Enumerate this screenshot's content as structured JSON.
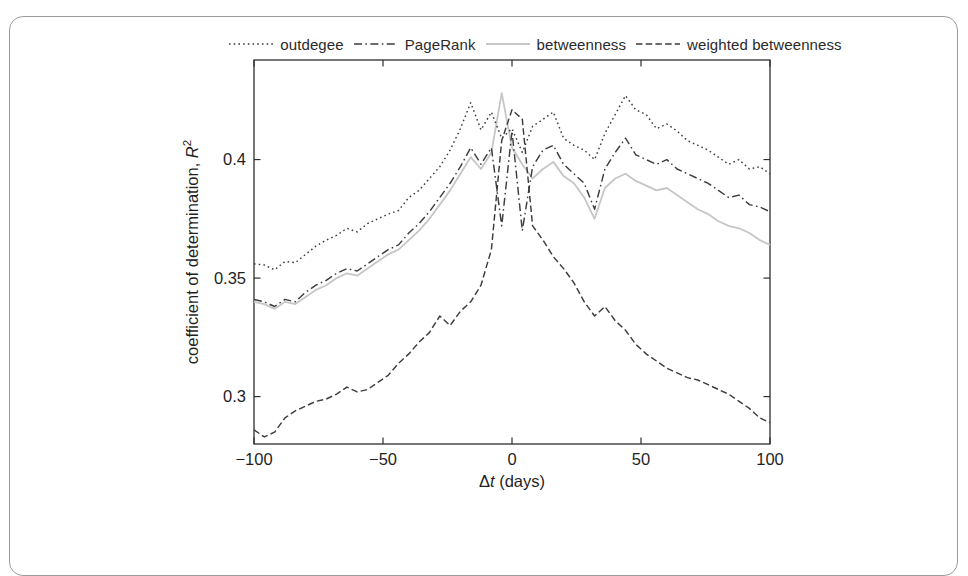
{
  "figure": {
    "background": "#ffffff",
    "border_color": "#9b9b9b",
    "line_dark_color": "#3d3d3d",
    "line_light_color": "#c6c6c6"
  },
  "axes": {
    "xlabel": {
      "delta": "Δ",
      "var": "t",
      "rest": " (days)"
    },
    "ylabel": {
      "text": "coefficient of determination, ",
      "var": "R",
      "sup": "2"
    },
    "xlim": [
      -100,
      100
    ],
    "ylim": [
      0.28,
      0.442
    ],
    "xticks": [
      {
        "v": -100,
        "label": "−100"
      },
      {
        "v": -50,
        "label": "−50"
      },
      {
        "v": 0,
        "label": "0"
      },
      {
        "v": 50,
        "label": "50"
      },
      {
        "v": 100,
        "label": "100"
      }
    ],
    "yticks": [
      {
        "v": 0.3,
        "label": "0.3"
      },
      {
        "v": 0.35,
        "label": "0.35"
      },
      {
        "v": 0.4,
        "label": "0.4"
      }
    ]
  },
  "chart_data": {
    "type": "line",
    "title": "",
    "xlabel": "Δt (days)",
    "ylabel": "coefficient of determination, R²",
    "xlim": [
      -100,
      100
    ],
    "ylim": [
      0.28,
      0.442
    ],
    "grid": false,
    "legend_position": "top-horizontal",
    "x": [
      -100,
      -96,
      -92,
      -88,
      -84,
      -80,
      -76,
      -72,
      -68,
      -64,
      -60,
      -56,
      -52,
      -48,
      -44,
      -40,
      -36,
      -32,
      -28,
      -24,
      -20,
      -16,
      -12,
      -8,
      -4,
      0,
      4,
      8,
      12,
      16,
      20,
      24,
      28,
      32,
      36,
      40,
      44,
      48,
      52,
      56,
      60,
      64,
      68,
      72,
      76,
      80,
      84,
      88,
      92,
      96,
      100
    ],
    "series": [
      {
        "name": "outdegee",
        "linestyle": "dotted",
        "color": "#3d3d3d",
        "values": [
          0.356,
          0.3555,
          0.3535,
          0.357,
          0.3565,
          0.36,
          0.3635,
          0.366,
          0.368,
          0.371,
          0.3695,
          0.373,
          0.375,
          0.377,
          0.3785,
          0.384,
          0.387,
          0.392,
          0.397,
          0.404,
          0.413,
          0.424,
          0.4125,
          0.42,
          0.409,
          0.413,
          0.403,
          0.414,
          0.417,
          0.42,
          0.409,
          0.406,
          0.404,
          0.4,
          0.411,
          0.419,
          0.427,
          0.421,
          0.419,
          0.413,
          0.415,
          0.412,
          0.408,
          0.406,
          0.404,
          0.401,
          0.398,
          0.4,
          0.396,
          0.397,
          0.394
        ]
      },
      {
        "name": "PageRank",
        "linestyle": "dash-dot",
        "color": "#3d3d3d",
        "values": [
          0.341,
          0.34,
          0.338,
          0.341,
          0.34,
          0.344,
          0.347,
          0.349,
          0.352,
          0.354,
          0.353,
          0.356,
          0.359,
          0.362,
          0.364,
          0.369,
          0.373,
          0.378,
          0.384,
          0.39,
          0.397,
          0.405,
          0.398,
          0.405,
          0.372,
          0.412,
          0.37,
          0.397,
          0.404,
          0.406,
          0.398,
          0.394,
          0.39,
          0.379,
          0.396,
          0.403,
          0.409,
          0.402,
          0.4,
          0.398,
          0.4,
          0.396,
          0.394,
          0.392,
          0.39,
          0.387,
          0.384,
          0.385,
          0.381,
          0.38,
          0.378
        ]
      },
      {
        "name": "betweenness",
        "linestyle": "solid",
        "color": "#c6c6c6",
        "values": [
          0.34,
          0.339,
          0.337,
          0.34,
          0.339,
          0.342,
          0.345,
          0.347,
          0.35,
          0.352,
          0.351,
          0.354,
          0.357,
          0.36,
          0.362,
          0.366,
          0.37,
          0.375,
          0.381,
          0.387,
          0.394,
          0.401,
          0.396,
          0.403,
          0.428,
          0.405,
          0.398,
          0.392,
          0.396,
          0.399,
          0.393,
          0.39,
          0.384,
          0.375,
          0.388,
          0.392,
          0.394,
          0.391,
          0.389,
          0.387,
          0.388,
          0.385,
          0.382,
          0.379,
          0.377,
          0.374,
          0.372,
          0.371,
          0.369,
          0.366,
          0.364
        ]
      },
      {
        "name": "weighted betweenness",
        "linestyle": "dashed",
        "color": "#3d3d3d",
        "values": [
          0.286,
          0.283,
          0.285,
          0.291,
          0.294,
          0.296,
          0.298,
          0.299,
          0.301,
          0.304,
          0.302,
          0.303,
          0.306,
          0.309,
          0.314,
          0.318,
          0.323,
          0.327,
          0.334,
          0.33,
          0.336,
          0.34,
          0.347,
          0.362,
          0.408,
          0.421,
          0.417,
          0.372,
          0.366,
          0.359,
          0.354,
          0.348,
          0.34,
          0.334,
          0.338,
          0.332,
          0.328,
          0.322,
          0.318,
          0.315,
          0.312,
          0.31,
          0.308,
          0.307,
          0.305,
          0.303,
          0.301,
          0.298,
          0.295,
          0.291,
          0.289
        ]
      }
    ]
  }
}
